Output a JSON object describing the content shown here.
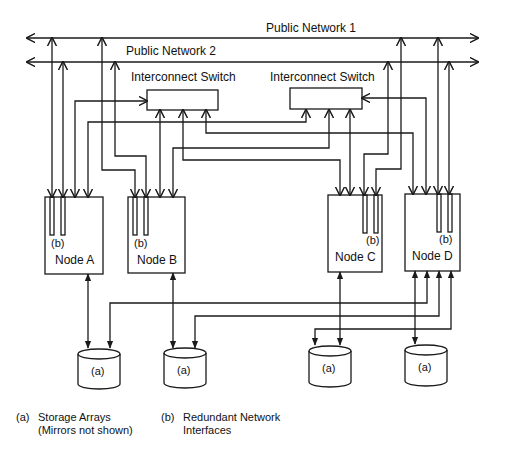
{
  "diagram": {
    "networks": [
      {
        "id": "public-network-1",
        "label": "Public Network 1"
      },
      {
        "id": "public-network-2",
        "label": "Public Network 2"
      }
    ],
    "switches": [
      {
        "id": "switch-1",
        "label": "Interconnect Switch"
      },
      {
        "id": "switch-2",
        "label": "Interconnect Switch"
      }
    ],
    "nodes": [
      {
        "id": "node-a",
        "label": "Node A",
        "nic_label": "(b)"
      },
      {
        "id": "node-b",
        "label": "Node B",
        "nic_label": "(b)"
      },
      {
        "id": "node-c",
        "label": "Node C",
        "nic_label": "(b)"
      },
      {
        "id": "node-d",
        "label": "Node D",
        "nic_label": "(b)"
      }
    ],
    "storage": [
      {
        "id": "storage-1",
        "label": "(a)"
      },
      {
        "id": "storage-2",
        "label": "(a)"
      },
      {
        "id": "storage-3",
        "label": "(a)"
      },
      {
        "id": "storage-4",
        "label": "(a)"
      }
    ],
    "legend": [
      {
        "key": "(a)",
        "line1": "Storage Arrays",
        "line2": "(Mirrors not shown)"
      },
      {
        "key": "(b)",
        "line1": "Redundant Network",
        "line2": "Interfaces"
      }
    ],
    "colors": {
      "stroke": "#1a1a1a",
      "background": "#ffffff"
    }
  }
}
